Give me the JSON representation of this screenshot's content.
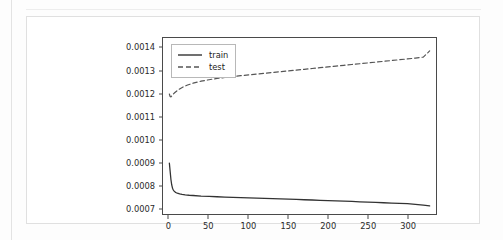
{
  "figure": {
    "background_color": "#ffffff",
    "axes_color": "#4a4a4a"
  },
  "chart_data": {
    "type": "line",
    "title": "",
    "xlabel": "",
    "ylabel": "",
    "xlim": [
      -8,
      336
    ],
    "ylim": [
      0.000675,
      0.001445
    ],
    "xticks": [
      0,
      50,
      100,
      150,
      200,
      250,
      300
    ],
    "xticklabels": [
      "0",
      "50",
      "100",
      "150",
      "200",
      "250",
      "300"
    ],
    "yticks": [
      0.0007,
      0.0008,
      0.0009,
      0.001,
      0.0011,
      0.0012,
      0.0013,
      0.0014
    ],
    "yticklabels": [
      "0.0007",
      "0.0008",
      "0.0009",
      "0.0010",
      "0.0011",
      "0.0012",
      "0.0013",
      "0.0014"
    ],
    "grid": false,
    "legend_position": "upper left",
    "legend_entries": [
      "train",
      "test"
    ],
    "series": [
      {
        "name": "train",
        "linestyle": "solid",
        "color": "#333333",
        "x": [
          0,
          1,
          2,
          3,
          4,
          5,
          6,
          8,
          10,
          13,
          16,
          20,
          25,
          30,
          40,
          50,
          60,
          70,
          80,
          90,
          100,
          110,
          120,
          130,
          140,
          150,
          160,
          170,
          180,
          190,
          200,
          210,
          220,
          230,
          240,
          250,
          260,
          270,
          280,
          290,
          300,
          310,
          320,
          328
        ],
        "y": [
          0.000898,
          0.000862,
          0.000826,
          0.000802,
          0.000788,
          0.00078,
          0.000775,
          0.000769,
          0.000766,
          0.000763,
          0.000761,
          0.000759,
          0.000757,
          0.000756,
          0.0007535,
          0.000752,
          0.0007505,
          0.000749,
          0.0007478,
          0.0007466,
          0.0007454,
          0.0007442,
          0.000743,
          0.000742,
          0.000741,
          0.0007398,
          0.0007386,
          0.0007374,
          0.0007362,
          0.000735,
          0.0007338,
          0.0007326,
          0.0007312,
          0.0007298,
          0.0007284,
          0.000727,
          0.0007256,
          0.0007242,
          0.0007228,
          0.0007214,
          0.00072,
          0.0007175,
          0.000714,
          0.0007105
        ]
      },
      {
        "name": "test",
        "linestyle": "dashed",
        "color": "#555555",
        "x": [
          0,
          1,
          2,
          3,
          4,
          5,
          7,
          10,
          14,
          18,
          23,
          30,
          40,
          50,
          60,
          70,
          80,
          90,
          100,
          110,
          120,
          130,
          140,
          150,
          160,
          170,
          180,
          190,
          200,
          210,
          220,
          230,
          240,
          250,
          260,
          270,
          280,
          290,
          300,
          310,
          320,
          328
        ],
        "y": [
          0.0012,
          0.001189,
          0.0011875,
          0.001191,
          0.001196,
          0.0012,
          0.0012065,
          0.001215,
          0.0012245,
          0.001232,
          0.0012392,
          0.0012475,
          0.001256,
          0.0012625,
          0.001268,
          0.0012725,
          0.0012765,
          0.00128,
          0.0012835,
          0.001287,
          0.0012905,
          0.001294,
          0.0012975,
          0.001301,
          0.0013045,
          0.001308,
          0.0013115,
          0.001315,
          0.0013185,
          0.001322,
          0.0013255,
          0.001329,
          0.0013325,
          0.001336,
          0.0013395,
          0.001343,
          0.0013465,
          0.00135,
          0.0013535,
          0.001357,
          0.0013615,
          0.0013885
        ]
      }
    ]
  }
}
